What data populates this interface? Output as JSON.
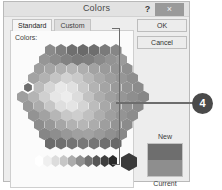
{
  "window": {
    "title": "Colors",
    "help_icon": "question-mark-icon",
    "help_label": "?",
    "close_icon": "close-icon",
    "close_label": "×"
  },
  "tabs": [
    {
      "label": "Standard",
      "selected": true
    },
    {
      "label": "Custom",
      "selected": false
    }
  ],
  "panel": {
    "colors_label": "Colors:"
  },
  "buttons": {
    "ok_label": "OK",
    "cancel_label": "Cancel"
  },
  "preview": {
    "new_label": "New",
    "current_label": "Current",
    "new_color": "#6e6e6e",
    "current_color": "#8e8e8e"
  },
  "annotation": {
    "badge_number": "4",
    "badge_color": "#4a4a4a",
    "leader_color": "#6d6d6d"
  },
  "palette": {
    "selected_index": 30,
    "hex_rows": [
      {
        "count": 7,
        "colors": [
          "#8a8a8a",
          "#7e7e7e",
          "#6f6f6f",
          "#6a6a6a",
          "#6e6e6e",
          "#7a7a7a",
          "#868686"
        ]
      },
      {
        "count": 8,
        "colors": [
          "#969696",
          "#8c8c8c",
          "#828282",
          "#7b7b7b",
          "#7e7e7e",
          "#898989",
          "#939393",
          "#9b9b9b"
        ]
      },
      {
        "count": 9,
        "colors": [
          "#9e9e9e",
          "#a6a6a6",
          "#b0b0b0",
          "#b6b6b6",
          "#aeaeae",
          "#a2a2a2",
          "#9a9a9a",
          "#949494",
          "#8f8f8f"
        ]
      },
      {
        "count": 10,
        "colors": [
          "#a3a3a3",
          "#b2b2b2",
          "#c4c4c4",
          "#d2d2d2",
          "#cacaca",
          "#b8b8b8",
          "#a9a9a9",
          "#9e9e9e",
          "#969696",
          "#8e8e8e"
        ]
      },
      {
        "count": 11,
        "colors": [
          "#a8a8a8",
          "#bcbcbc",
          "#d6d6d6",
          "#e8e8e8",
          "#e0e0e0",
          "#c9c9c9",
          "#b3b3b3",
          "#a4a4a4",
          "#9a9a9a",
          "#929292",
          "#8b8b8b"
        ]
      },
      {
        "count": 12,
        "colors": [
          "#9f9f9f",
          "#b4b4b4",
          "#d0d0d0",
          "#e6e6e6",
          "#ededed",
          "#dcdcdc",
          "#c2c2c2",
          "#adadad",
          "#a0a0a0",
          "#969696",
          "#8e8e8e",
          "#878787"
        ]
      },
      {
        "count": 11,
        "colors": [
          "#999999",
          "#acacac",
          "#c6c6c6",
          "#dedede",
          "#e4e4e4",
          "#d4d4d4",
          "#bcbcbc",
          "#a8a8a8",
          "#9c9c9c",
          "#929292",
          "#8a8a8a"
        ]
      },
      {
        "count": 10,
        "colors": [
          "#939393",
          "#a2a2a2",
          "#b6b6b6",
          "#c8c8c8",
          "#cecece",
          "#c0c0c0",
          "#aeaeae",
          "#9f9f9f",
          "#949494",
          "#8c8c8c"
        ]
      },
      {
        "count": 9,
        "colors": [
          "#8d8d8d",
          "#989898",
          "#a6a6a6",
          "#b2b2b2",
          "#b6b6b6",
          "#acacac",
          "#9e9e9e",
          "#949494",
          "#8b8b8b"
        ]
      },
      {
        "count": 8,
        "colors": [
          "#868686",
          "#8e8e8e",
          "#989898",
          "#a0a0a0",
          "#a2a2a2",
          "#9a9a9a",
          "#909090",
          "#888888"
        ]
      },
      {
        "count": 7,
        "colors": [
          "#6b6b6b",
          "#6f6f6f",
          "#747474",
          "#787878",
          "#757575",
          "#6e6e6e",
          "#686868"
        ]
      }
    ],
    "ramp_colors": [
      "#ffffff",
      "#efefef",
      "#dcdcdc",
      "#c6c6c6",
      "#ababab",
      "#8e8e8e",
      "#717171",
      "#565656",
      "#3e3e3e",
      "#2a2a2a"
    ],
    "ramp_big_color": "#3a3a3a"
  }
}
